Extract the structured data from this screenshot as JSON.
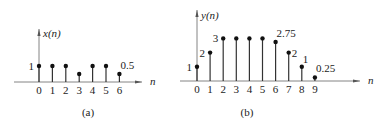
{
  "chart_data": [
    {
      "type": "stem",
      "panel_label": "(a)",
      "ylabel": "x(n)",
      "xlabel": "n",
      "x": [
        0,
        1,
        2,
        3,
        4,
        5,
        6
      ],
      "values": [
        1,
        1,
        1,
        0.5,
        1,
        1,
        0.5
      ],
      "annotations": [
        {
          "n": 0,
          "text": "1",
          "side": "left"
        },
        {
          "n": 6,
          "text": "0.5",
          "side": "above-right"
        }
      ],
      "tick_labels": [
        "0",
        "1",
        "2",
        "3",
        "4",
        "5",
        "6"
      ]
    },
    {
      "type": "stem",
      "panel_label": "(b)",
      "ylabel": "y(n)",
      "xlabel": "n",
      "x": [
        0,
        1,
        2,
        3,
        4,
        5,
        6,
        7,
        8,
        9
      ],
      "values": [
        1,
        2,
        3,
        3,
        3,
        3,
        2.75,
        2,
        1,
        0.25
      ],
      "annotations": [
        {
          "n": 0,
          "text": "1",
          "side": "left"
        },
        {
          "n": 1,
          "text": "2",
          "side": "left"
        },
        {
          "n": 2,
          "text": "3",
          "side": "left"
        },
        {
          "n": 6,
          "text": "2.75",
          "side": "above-right"
        },
        {
          "n": 7,
          "text": "2",
          "side": "right"
        },
        {
          "n": 8,
          "text": "1",
          "side": "above"
        },
        {
          "n": 9,
          "text": "0.25",
          "side": "above-right"
        }
      ],
      "tick_labels": [
        "0",
        "1",
        "2",
        "3",
        "4",
        "5",
        "6",
        "7",
        "8",
        "9"
      ]
    }
  ]
}
